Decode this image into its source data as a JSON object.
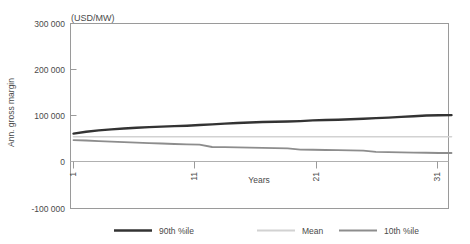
{
  "chart_data": {
    "type": "line",
    "title": "",
    "unit_label": "(USD/MW)",
    "xlabel": "Years",
    "ylabel": "Ann. gross margin",
    "xlim": [
      1,
      31
    ],
    "ylim": [
      -100000,
      300000
    ],
    "ytick_labels": [
      "300 000",
      "200 000",
      "100 000",
      "0",
      "-100 000"
    ],
    "ytick_values": [
      300000,
      200000,
      100000,
      0,
      -100000
    ],
    "xtick_labels": [
      "1",
      "11",
      "21",
      "31"
    ],
    "xtick_values": [
      1,
      11,
      21,
      31
    ],
    "grid": false,
    "legend_position": "below",
    "x": [
      1,
      2,
      3,
      4,
      5,
      6,
      7,
      8,
      9,
      10,
      11,
      12,
      13,
      14,
      15,
      16,
      17,
      18,
      19,
      20,
      21,
      22,
      23,
      24,
      25,
      26,
      27,
      28,
      29,
      30,
      31
    ],
    "series": [
      {
        "name": "90th %ile",
        "color": "#333333",
        "width": 2.4,
        "values": [
          62000,
          66000,
          69000,
          71000,
          73000,
          74500,
          76000,
          77000,
          78000,
          79000,
          80500,
          82000,
          83500,
          85000,
          86000,
          87000,
          87500,
          88000,
          89000,
          90500,
          91500,
          92000,
          93000,
          94000,
          95500,
          96500,
          98000,
          99500,
          101000,
          101500,
          102000
        ]
      },
      {
        "name": "Mean",
        "color": "#d2d2d2",
        "width": 1.6,
        "values": [
          55000,
          55000,
          55000,
          55000,
          55000,
          55000,
          55000,
          55000,
          55000,
          55000,
          55000,
          55000,
          55000,
          55000,
          55000,
          55000,
          55000,
          55000,
          55000,
          55000,
          55000,
          55000,
          55000,
          55000,
          55000,
          55000,
          55000,
          55000,
          55000,
          55000,
          55000
        ]
      },
      {
        "name": "10th %ile",
        "color": "#8d8d8d",
        "width": 1.8,
        "values": [
          48000,
          47000,
          45500,
          44500,
          43500,
          42500,
          41500,
          40500,
          39500,
          38500,
          38000,
          33000,
          32500,
          32000,
          31500,
          31000,
          30500,
          30000,
          27500,
          27000,
          26500,
          26000,
          25500,
          25000,
          22500,
          22000,
          21500,
          21000,
          20500,
          20000,
          20000
        ]
      }
    ]
  },
  "legend": {
    "items": [
      {
        "label": "90th %ile"
      },
      {
        "label": "Mean"
      },
      {
        "label": "10th %ile"
      }
    ]
  }
}
